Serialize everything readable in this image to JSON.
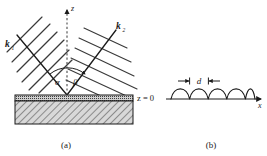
{
  "figure": {
    "panels": [
      {
        "id": "a",
        "caption": "(a)",
        "axis_label_z": "z",
        "surface_label": "z = 0",
        "vectors": [
          {
            "name": "k1",
            "symbol": "k",
            "subscript": "1",
            "side": "left"
          },
          {
            "name": "k2",
            "symbol": "k",
            "subscript": "2",
            "side": "right"
          }
        ],
        "angles": [
          {
            "name": "alpha",
            "symbol": "α",
            "side": "left"
          },
          {
            "name": "beta",
            "symbol": "β",
            "side": "right"
          }
        ]
      },
      {
        "id": "b",
        "caption": "(b)",
        "axis_label_x": "x",
        "period_label": "d",
        "hump_count": 5
      }
    ]
  },
  "colors": {
    "ink": "#1a1a1a",
    "hatch": "#555555",
    "substrate_fill": "#d8d8d8",
    "wavefront": "#3a3a3a",
    "dashed_axis": "#666666"
  }
}
